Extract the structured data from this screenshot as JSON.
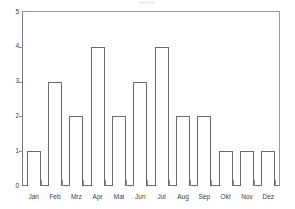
{
  "chart_data": {
    "type": "bar",
    "title": "",
    "subtitle": "",
    "xlabel": "",
    "ylabel": "",
    "categories": [
      "Jan",
      "Feb",
      "Mrz",
      "Apr",
      "Mai",
      "Jun",
      "Jul",
      "Aug",
      "Sep",
      "Okt",
      "Nov",
      "Dez"
    ],
    "values": [
      1,
      3,
      2,
      4,
      2,
      3,
      4,
      2,
      2,
      1,
      1,
      1
    ],
    "ylim": [
      0,
      5
    ],
    "yticks": [
      "0",
      "1",
      "2",
      "3",
      "4",
      "5"
    ],
    "grid": false,
    "legend": false,
    "legend_position": "none",
    "bar_fill_color": "#ffffff",
    "bar_edge_color": "#6b6b6b",
    "axis_color": "#7a7a7a",
    "text_color": "#3b3b3b",
    "background_color": "#ffffff"
  }
}
